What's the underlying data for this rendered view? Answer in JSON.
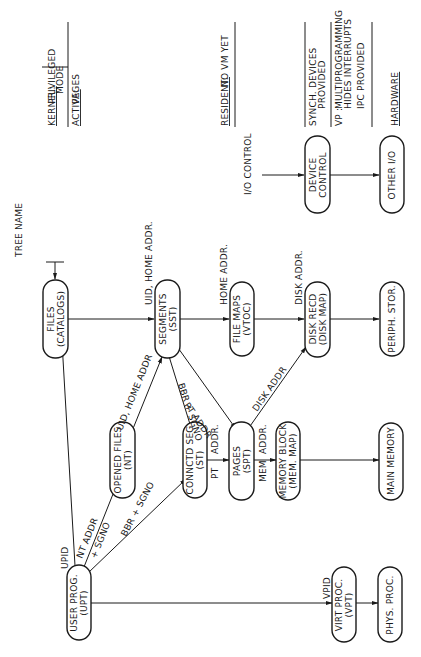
{
  "diagram": {
    "orientation": "rotated-90-ccw",
    "nodes": [
      {
        "id": "files",
        "line1": "FILES",
        "line2": "(CATALOGS)"
      },
      {
        "id": "segments",
        "line1": "SEGMENTS",
        "line2": "(SST)"
      },
      {
        "id": "file_maps",
        "line1": "FILE MAPS",
        "line2": "(VTOC)"
      },
      {
        "id": "disk_recd",
        "line1": "DISK RECD",
        "line2": "(DISK MAP)"
      },
      {
        "id": "periph_stor",
        "line1": "PERIPH. STOR.",
        "line2": ""
      },
      {
        "id": "opened_files",
        "line1": "OPENED FILES",
        "line2": "(NT)"
      },
      {
        "id": "connctd_seg",
        "line1": "CONNCTD SEG",
        "line2": "(ST)"
      },
      {
        "id": "pages",
        "line1": "PAGES",
        "line2": "(SPT)"
      },
      {
        "id": "memory_block",
        "line1": "MEMORY BLOCK",
        "line2": "(MEM. MAP)"
      },
      {
        "id": "main_memory",
        "line1": "MAIN MEMORY",
        "line2": ""
      },
      {
        "id": "user_prog",
        "line1": "USER PROG.",
        "line2": "(UPT)"
      },
      {
        "id": "virt_proc",
        "line1": "VIRT PROC.",
        "line2": "(VPT)"
      },
      {
        "id": "phys_proc",
        "line1": "PHYS. PROC.",
        "line2": ""
      },
      {
        "id": "device_control",
        "line1": "DEVICE",
        "line2": "CONTROL"
      },
      {
        "id": "other_io",
        "line1": "OTHER I/O",
        "line2": ""
      }
    ],
    "edge_labels": {
      "tree_name": "TREE NAME",
      "uid_home_addr_top": "UID, HOME ADDR.",
      "home_addr": "HOME ADDR.",
      "disk_addr_top": "DISK ADDR.",
      "uid_home_addr_diag": "UID, HOME ADDR",
      "bbr_sgno_diag": "BBR + SGNO",
      "pt_addr_diag": "PT ADDR",
      "disk_addr_diag": "DISK ADDR",
      "upid": "UPID",
      "nt_addr": "NT ADDR",
      "plus_sgno": "+ SGNO",
      "bbr_sgno_low": "BBR + SGNO",
      "pt_addr_h_1": "PT",
      "pt_addr_h_2": "ADDR.",
      "mem_addr_1": "MEM",
      "mem_addr_2": "ADDR.",
      "vpid": "VPID",
      "io_control": "I/O CONTROL"
    },
    "legend": {
      "kernel_key": "KERNEL:",
      "kernel_val_1": "PRIVILEGED",
      "kernel_val_2": "MODE",
      "active_key": "ACTIVE:",
      "active_val": "PAGES",
      "resident_key": "RESIDENT:",
      "resident_val": "NO VM YET",
      "synch_1": "SYNCH. DEVICES",
      "synch_2": "PROVIDED",
      "vp_key": "VP :",
      "vp_1": "MULTIPROGRAMMING",
      "vp_2": "HIDES INTERRUPTS",
      "vp_3": "IPC  PROVIDED",
      "hardware": "HARDWARE"
    }
  }
}
